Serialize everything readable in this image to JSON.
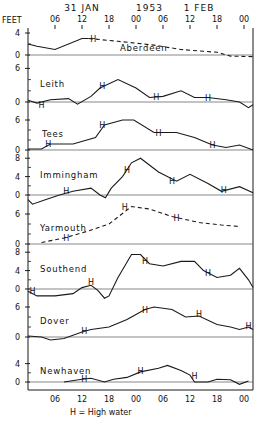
{
  "chart_data": {
    "type": "line",
    "date_labels": [
      {
        "label": "31 JAN",
        "hour": 12
      },
      {
        "label": "1953",
        "hour": 27
      },
      {
        "label": "1 FEB",
        "hour": 38
      }
    ],
    "ylabel": "FEET",
    "x_ticks": [
      {
        "label": "06",
        "hour": 6
      },
      {
        "label": "12",
        "hour": 12
      },
      {
        "label": "18",
        "hour": 18
      },
      {
        "label": "00",
        "hour": 24
      },
      {
        "label": "06",
        "hour": 30
      },
      {
        "label": "12",
        "hour": 36
      },
      {
        "label": "18",
        "hour": 42
      },
      {
        "label": "00",
        "hour": 48
      }
    ],
    "legend_note": "H = High water",
    "xlim": [
      0,
      50
    ],
    "panels": [
      {
        "name": "Aberdeen",
        "zero_y": 55,
        "px_per_ft": 5.5,
        "yticks": [
          0,
          4
        ],
        "solid": [
          [
            0,
            2
          ],
          [
            2,
            1.6
          ],
          [
            6,
            1
          ],
          [
            12,
            3
          ],
          [
            13.5,
            3
          ]
        ],
        "dashed": [
          [
            13.5,
            3
          ],
          [
            20,
            2.5
          ],
          [
            28,
            1.8
          ],
          [
            34,
            1
          ],
          [
            42,
            0.5
          ],
          [
            45,
            -0.2
          ],
          [
            50,
            -0.3
          ]
        ],
        "H": [
          [
            14.5,
            3
          ]
        ]
      },
      {
        "name": "Leith",
        "zero_y": 102,
        "px_per_ft": 5.6,
        "yticks": [
          0,
          6
        ],
        "solid": [
          [
            0,
            0.3
          ],
          [
            2,
            -0.2
          ],
          [
            5,
            0.4
          ],
          [
            9,
            0.6
          ],
          [
            11,
            -0.4
          ],
          [
            14,
            1
          ],
          [
            16,
            2.5
          ],
          [
            20,
            4
          ],
          [
            24,
            2.5
          ],
          [
            27,
            0.8
          ],
          [
            30,
            1
          ],
          [
            34,
            2
          ],
          [
            37,
            0.8
          ],
          [
            40,
            0.8
          ],
          [
            44,
            0.4
          ],
          [
            47,
            0
          ],
          [
            49,
            -1
          ],
          [
            50,
            -0.5
          ]
        ],
        "H": [
          [
            3,
            -0.5
          ],
          [
            16.5,
            2.8
          ],
          [
            28.5,
            0.9
          ],
          [
            40,
            0.8
          ]
        ]
      },
      {
        "name": "Tees",
        "zero_y": 150,
        "px_per_ft": 5.0,
        "yticks": [
          0,
          6
        ],
        "solid": [
          [
            0,
            0.2
          ],
          [
            3,
            0.2
          ],
          [
            5,
            1.2
          ],
          [
            10,
            1.2
          ],
          [
            15,
            2.5
          ],
          [
            17,
            5
          ],
          [
            21,
            6
          ],
          [
            23.5,
            6
          ],
          [
            28,
            3.5
          ],
          [
            33,
            3.5
          ],
          [
            37,
            2.5
          ],
          [
            41,
            1
          ],
          [
            44,
            0.5
          ],
          [
            47,
            1
          ],
          [
            50,
            0
          ]
        ],
        "H": [
          [
            4.5,
            1.2
          ],
          [
            16.5,
            5
          ],
          [
            29,
            3.5
          ],
          [
            41,
            1
          ]
        ]
      },
      {
        "name": "Immingham",
        "zero_y": 195,
        "px_per_ft": 4.6,
        "yticks": [
          0,
          4,
          8
        ],
        "solid": [
          [
            0,
            -1
          ],
          [
            1,
            -2
          ],
          [
            4,
            -1
          ],
          [
            7,
            0
          ],
          [
            10,
            0.8
          ],
          [
            14,
            1.5
          ],
          [
            16,
            0
          ],
          [
            17.2,
            -0.6
          ],
          [
            18.5,
            1.5
          ],
          [
            21,
            4
          ],
          [
            23,
            7
          ],
          [
            25,
            8
          ],
          [
            29,
            5
          ],
          [
            33,
            3
          ],
          [
            36,
            4.5
          ],
          [
            40,
            2.5
          ],
          [
            43,
            0.8
          ],
          [
            47,
            1.8
          ],
          [
            50,
            0.5
          ]
        ],
        "H": [
          [
            8.5,
            0.8
          ],
          [
            22,
            5.5
          ],
          [
            32,
            3
          ],
          [
            43.5,
            1
          ]
        ]
      },
      {
        "name": "Yarmouth",
        "zero_y": 244,
        "px_per_ft": 5.0,
        "yticks": [
          0,
          6
        ],
        "dashed": [
          [
            3,
            0.3
          ],
          [
            8,
            1.2
          ],
          [
            13,
            2.5
          ],
          [
            18,
            4
          ],
          [
            23,
            7.5
          ],
          [
            27,
            7
          ],
          [
            32,
            5.5
          ],
          [
            38,
            4.3
          ],
          [
            43,
            3.8
          ],
          [
            47,
            3.5
          ]
        ],
        "H": [
          [
            8.5,
            1.3
          ],
          [
            21.5,
            7.5
          ],
          [
            33,
            5.2
          ]
        ]
      },
      {
        "name": "Southend",
        "zero_y": 289,
        "px_per_ft": 4.6,
        "yticks": [
          0,
          4,
          8
        ],
        "solid": [
          [
            0,
            -0.5
          ],
          [
            2,
            -1.5
          ],
          [
            6,
            -1.5
          ],
          [
            10,
            -1
          ],
          [
            12,
            0.3
          ],
          [
            14,
            0.8
          ],
          [
            15.5,
            -0.3
          ],
          [
            17,
            -2
          ],
          [
            18,
            -1.5
          ],
          [
            20,
            2.5
          ],
          [
            23,
            7.5
          ],
          [
            25,
            7.5
          ],
          [
            27,
            5.5
          ],
          [
            30,
            5
          ],
          [
            34,
            6
          ],
          [
            37,
            6
          ],
          [
            39,
            4
          ],
          [
            42,
            2.5
          ],
          [
            45,
            3
          ],
          [
            47,
            4.5
          ],
          [
            49,
            2
          ],
          [
            50,
            0.3
          ]
        ],
        "H": [
          [
            1,
            -0.5
          ],
          [
            14,
            1.5
          ],
          [
            26,
            6
          ],
          [
            40,
            3.5
          ]
        ]
      },
      {
        "name": "Dover",
        "zero_y": 337,
        "px_per_ft": 5.0,
        "yticks": [
          0,
          6
        ],
        "solid": [
          [
            0,
            0.2
          ],
          [
            3,
            0
          ],
          [
            5,
            -0.6
          ],
          [
            8,
            -0.3
          ],
          [
            12,
            1
          ],
          [
            14,
            1.5
          ],
          [
            18,
            2
          ],
          [
            22,
            3.5
          ],
          [
            26,
            5.5
          ],
          [
            28,
            6
          ],
          [
            32,
            5.5
          ],
          [
            35,
            4
          ],
          [
            38,
            4.2
          ],
          [
            42,
            2.5
          ],
          [
            45,
            2
          ],
          [
            47,
            1.5
          ],
          [
            49,
            2
          ],
          [
            50,
            1.5
          ]
        ],
        "H": [
          [
            12.5,
            1.2
          ],
          [
            26,
            5.4
          ],
          [
            38,
            4.6
          ],
          [
            49,
            2.3
          ]
        ]
      },
      {
        "name": "Newhaven",
        "zero_y": 382,
        "px_per_ft": 4.6,
        "yticks": [
          0,
          4
        ],
        "solid": [
          [
            8,
            0
          ],
          [
            12,
            0.6
          ],
          [
            14,
            0.8
          ],
          [
            17,
            0
          ],
          [
            19,
            0.6
          ],
          [
            22,
            1
          ],
          [
            25,
            2.2
          ],
          [
            29,
            3
          ],
          [
            31,
            3.6
          ],
          [
            34,
            2.5
          ],
          [
            36,
            1.5
          ],
          [
            37,
            0
          ],
          [
            40,
            0
          ],
          [
            42,
            0.6
          ],
          [
            45,
            0.5
          ],
          [
            47,
            -0.5
          ],
          [
            49,
            0.2
          ]
        ],
        "H": [
          [
            12.5,
            0.7
          ],
          [
            25,
            2.4
          ],
          [
            37,
            1.2
          ]
        ]
      }
    ]
  }
}
